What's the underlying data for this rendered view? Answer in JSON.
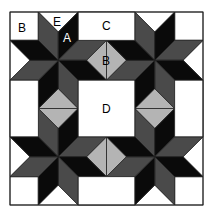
{
  "diagram": {
    "colors": {
      "black": "#0a0a0a",
      "dark_gray": "#4a4a4a",
      "light_gray": "#b4b4b4",
      "white": "#ffffff",
      "outline": "#222222"
    },
    "labels": {
      "corner_square": "B",
      "side_triangle": "E",
      "star_diamond": "A",
      "top_rectangle": "C",
      "center_diamond": "B",
      "center_square": "D"
    }
  }
}
